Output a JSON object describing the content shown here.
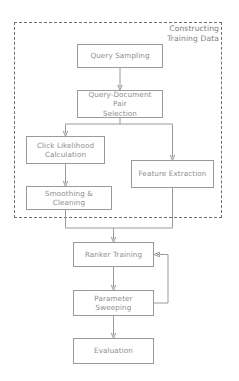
{
  "diagram": {
    "background_color": "#ffffff",
    "node_border_color": "#9a9a9a",
    "edge_color": "#9a9a9a",
    "text_color": "#8d8d8d",
    "group_border_color": "#6f6f6f",
    "group": {
      "label_line_1": "Constructing",
      "label_line_2": "Training Data",
      "style": "dashed"
    },
    "nodes": [
      {
        "id": "query-sampling",
        "label": "Query Sampling"
      },
      {
        "id": "qd-pair-selection",
        "label_line_1": "Query-Document Pair",
        "label_line_2": "Selection"
      },
      {
        "id": "click-likelihood",
        "label_line_1": "Click Likelihood",
        "label_line_2": "Calculation"
      },
      {
        "id": "feature-extraction",
        "label": "Feature Extraction"
      },
      {
        "id": "smoothing-cleaning",
        "label": "Smoothing & Cleaning"
      },
      {
        "id": "ranker-training",
        "label": "Ranker Training"
      },
      {
        "id": "parameter-sweeping",
        "label": "Parameter Sweeping"
      },
      {
        "id": "evaluation",
        "label": "Evaluation"
      }
    ],
    "edges": [
      {
        "from": "query-sampling",
        "to": "qd-pair-selection",
        "type": "arrow"
      },
      {
        "from": "qd-pair-selection",
        "to": "click-likelihood",
        "type": "split-arrow"
      },
      {
        "from": "qd-pair-selection",
        "to": "feature-extraction",
        "type": "split-arrow"
      },
      {
        "from": "click-likelihood",
        "to": "smoothing-cleaning",
        "type": "arrow"
      },
      {
        "from": "smoothing-cleaning",
        "to": "ranker-training",
        "type": "merge-arrow"
      },
      {
        "from": "feature-extraction",
        "to": "ranker-training",
        "type": "merge-arrow"
      },
      {
        "from": "ranker-training",
        "to": "parameter-sweeping",
        "type": "arrow"
      },
      {
        "from": "parameter-sweeping",
        "to": "ranker-training",
        "type": "feedback-arrow"
      },
      {
        "from": "parameter-sweeping",
        "to": "evaluation",
        "type": "arrow"
      }
    ]
  }
}
